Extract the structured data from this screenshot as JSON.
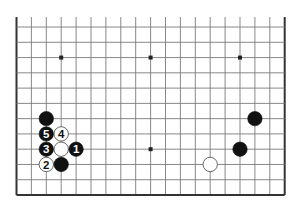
{
  "diagram": {
    "type": "go-board-partial",
    "board_size": 19,
    "visible_columns": [
      0,
      18
    ],
    "visible_rows": [
      7,
      18
    ],
    "edges_shown": [
      "left",
      "right",
      "bottom"
    ],
    "star_points": [
      {
        "col": 3,
        "row": 9
      },
      {
        "col": 9,
        "row": 9
      },
      {
        "col": 15,
        "row": 9
      },
      {
        "col": 3,
        "row": 15
      },
      {
        "col": 9,
        "row": 15
      },
      {
        "col": 15,
        "row": 15
      }
    ],
    "stones": [
      {
        "color": "black",
        "col": 2,
        "row": 13,
        "label": ""
      },
      {
        "color": "black",
        "col": 2,
        "row": 14,
        "label": "5"
      },
      {
        "color": "white",
        "col": 3,
        "row": 14,
        "label": "4"
      },
      {
        "color": "black",
        "col": 2,
        "row": 15,
        "label": "3"
      },
      {
        "color": "white",
        "col": 3,
        "row": 15,
        "label": ""
      },
      {
        "color": "black",
        "col": 4,
        "row": 15,
        "label": "1"
      },
      {
        "color": "white",
        "col": 2,
        "row": 16,
        "label": "2"
      },
      {
        "color": "black",
        "col": 3,
        "row": 16,
        "label": ""
      },
      {
        "color": "black",
        "col": 16,
        "row": 13,
        "label": ""
      },
      {
        "color": "black",
        "col": 15,
        "row": 15,
        "label": ""
      },
      {
        "color": "white",
        "col": 13,
        "row": 16,
        "label": ""
      }
    ],
    "colors": {
      "grid": "#7a7a7a",
      "edge": "#333333",
      "black_stone": "#111111",
      "white_stone": "#ffffff",
      "star": "#222222"
    }
  }
}
